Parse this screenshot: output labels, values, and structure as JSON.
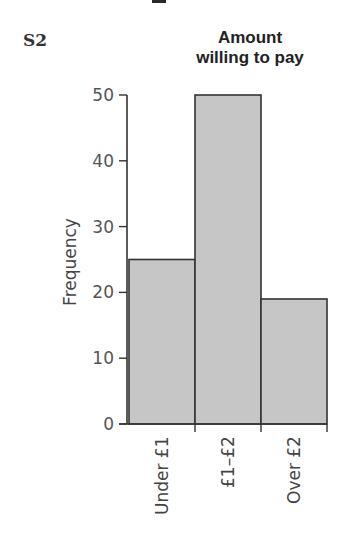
{
  "section_label": "S2",
  "chart_data": {
    "type": "bar",
    "title": "Amount willing to pay",
    "title_lines": [
      "Amount",
      "willing to pay"
    ],
    "xlabel": "",
    "ylabel": "Frequency",
    "categories": [
      "Under £1",
      "£1–£2",
      "Over £2"
    ],
    "values": [
      25,
      50,
      19
    ],
    "ylim": [
      0,
      50
    ],
    "yticks": [
      0,
      10,
      20,
      30,
      40,
      50
    ],
    "grid": false,
    "legend": null,
    "bar_color": "#c6c6c6",
    "edge_color": "#333333",
    "bars_adjacent": true
  }
}
